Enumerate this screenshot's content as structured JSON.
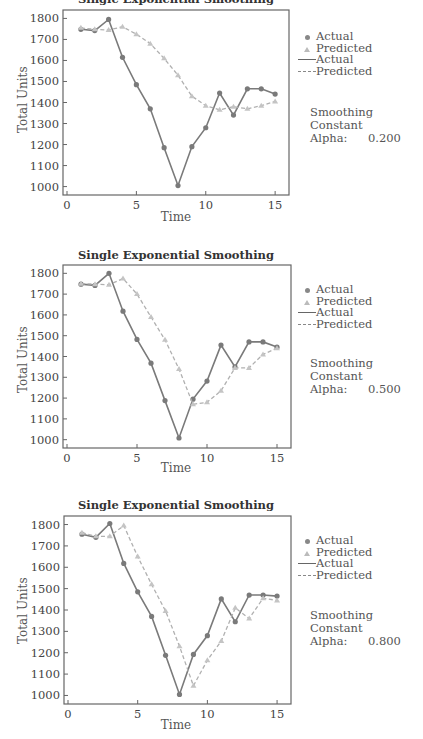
{
  "chart_data": [
    {
      "type": "line",
      "title": "Single Exponential Smoothing",
      "xlabel": "Time",
      "ylabel": "Total Units",
      "xticks": [
        0,
        5,
        10,
        15
      ],
      "yticks": [
        1000,
        1100,
        1200,
        1300,
        1400,
        1500,
        1600,
        1700,
        1800
      ],
      "xlim": [
        0,
        16
      ],
      "ylim": [
        960,
        1840
      ],
      "grid": false,
      "legend_position": "right",
      "x": [
        1,
        2,
        3,
        4,
        5,
        6,
        7,
        8,
        9,
        10,
        11,
        12,
        13,
        14,
        15
      ],
      "series": [
        {
          "name": "Actual",
          "style": "solid",
          "marker": "circle",
          "values": [
            1748,
            1742,
            1795,
            1615,
            1485,
            1370,
            1185,
            1005,
            1190,
            1280,
            1445,
            1340,
            1465,
            1465,
            1440
          ]
        },
        {
          "name": "Predicted",
          "style": "dashed",
          "marker": "triangle",
          "values": [
            1755,
            1748,
            1745,
            1760,
            1725,
            1680,
            1610,
            1530,
            1430,
            1385,
            1365,
            1380,
            1370,
            1385,
            1405
          ]
        }
      ],
      "legend": [
        "Actual",
        "Predicted",
        "Actual",
        "Predicted"
      ],
      "annotation": {
        "label": "Smoothing Constant",
        "alpha_label": "Alpha:",
        "alpha_value": "0.200"
      }
    },
    {
      "type": "line",
      "title": "Single Exponential Smoothing",
      "xlabel": "Time",
      "ylabel": "Total Units",
      "xticks": [
        0,
        5,
        10,
        15
      ],
      "yticks": [
        1000,
        1100,
        1200,
        1300,
        1400,
        1500,
        1600,
        1700,
        1800
      ],
      "xlim": [
        0,
        16
      ],
      "ylim": [
        960,
        1840
      ],
      "grid": false,
      "legend_position": "right",
      "x": [
        1,
        2,
        3,
        4,
        5,
        6,
        7,
        8,
        9,
        10,
        11,
        12,
        13,
        14,
        15
      ],
      "series": [
        {
          "name": "Actual",
          "style": "solid",
          "marker": "circle",
          "values": [
            1748,
            1742,
            1800,
            1618,
            1482,
            1368,
            1188,
            1008,
            1195,
            1282,
            1455,
            1350,
            1470,
            1470,
            1445
          ]
        },
        {
          "name": "Predicted",
          "style": "dashed",
          "marker": "triangle",
          "values": [
            1750,
            1748,
            1745,
            1775,
            1700,
            1590,
            1480,
            1340,
            1170,
            1180,
            1235,
            1345,
            1345,
            1410,
            1440
          ]
        }
      ],
      "legend": [
        "Actual",
        "Predicted",
        "Actual",
        "Predicted"
      ],
      "annotation": {
        "label": "Smoothing Constant",
        "alpha_label": "Alpha:",
        "alpha_value": "0.500"
      }
    },
    {
      "type": "line",
      "title": "Single Exponential Smoothing",
      "xlabel": "Time",
      "ylabel": "Total Units",
      "xticks": [
        0,
        5,
        10,
        15
      ],
      "yticks": [
        1000,
        1100,
        1200,
        1300,
        1400,
        1500,
        1600,
        1700,
        1800
      ],
      "xlim": [
        0,
        16
      ],
      "ylim": [
        960,
        1840
      ],
      "grid": false,
      "legend_position": "right",
      "x": [
        1,
        2,
        3,
        4,
        5,
        6,
        7,
        8,
        9,
        10,
        11,
        12,
        13,
        14,
        15
      ],
      "series": [
        {
          "name": "Actual",
          "style": "solid",
          "marker": "circle",
          "values": [
            1755,
            1740,
            1805,
            1618,
            1485,
            1370,
            1188,
            1005,
            1192,
            1280,
            1452,
            1345,
            1470,
            1470,
            1465
          ]
        },
        {
          "name": "Predicted",
          "style": "dashed",
          "marker": "triangle",
          "values": [
            1762,
            1745,
            1745,
            1795,
            1650,
            1520,
            1395,
            1230,
            1045,
            1165,
            1255,
            1410,
            1360,
            1455,
            1445
          ]
        }
      ],
      "legend": [
        "Actual",
        "Predicted",
        "Actual",
        "Predicted"
      ],
      "annotation": {
        "label": "Smoothing Constant",
        "alpha_label": "Alpha:",
        "alpha_value": "0.800"
      }
    }
  ],
  "panels": [
    {
      "title": "Single Exponential Smoothing",
      "xlabel": "Time",
      "ylabel": "Total Units",
      "legend": {
        "marker_actual": "Actual",
        "marker_predicted": "Predicted",
        "line_actual": "Actual",
        "line_predicted": "Predicted"
      },
      "smoothing_label": "Smoothing Constant",
      "alpha_label": "Alpha:",
      "alpha_value": "0.200"
    },
    {
      "title": "Single Exponential Smoothing",
      "xlabel": "Time",
      "ylabel": "Total Units",
      "legend": {
        "marker_actual": "Actual",
        "marker_predicted": "Predicted",
        "line_actual": "Actual",
        "line_predicted": "Predicted"
      },
      "smoothing_label": "Smoothing Constant",
      "alpha_label": "Alpha:",
      "alpha_value": "0.500"
    },
    {
      "title": "Single Exponential Smoothing",
      "xlabel": "Time",
      "ylabel": "Total Units",
      "legend": {
        "marker_actual": "Actual",
        "marker_predicted": "Predicted",
        "line_actual": "Actual",
        "line_predicted": "Predicted"
      },
      "smoothing_label": "Smoothing Constant",
      "alpha_label": "Alpha:",
      "alpha_value": "0.800"
    }
  ],
  "colors": {
    "actual": "#7a7a7a",
    "predicted": "#b0b0b0",
    "axis": "#666666",
    "text": "#444444"
  }
}
